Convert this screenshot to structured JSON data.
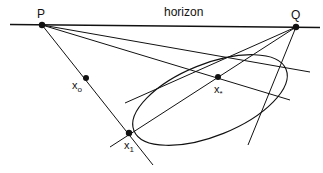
{
  "figure": {
    "horizon_label": "horizon",
    "points": {
      "P": {
        "label": "P",
        "x": 42,
        "y": 25
      },
      "Q": {
        "label": "Q",
        "x": 296,
        "y": 27
      },
      "x0": {
        "label": "x",
        "sub": "o",
        "x": 86,
        "y": 78
      },
      "xstar": {
        "label": "x",
        "sub": "*",
        "x": 218,
        "y": 77
      },
      "x1": {
        "label": "x",
        "sub": "1",
        "x": 129,
        "y": 133
      }
    },
    "ellipse": {
      "cx": 210,
      "cy": 100,
      "rx": 82,
      "ry": 36,
      "rotation_deg": -22
    },
    "colors": {
      "stroke": "#111111",
      "background": "#ffffff"
    }
  }
}
